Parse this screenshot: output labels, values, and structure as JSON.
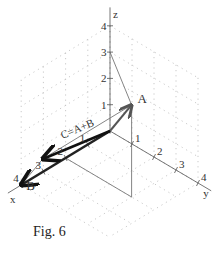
{
  "figure": {
    "caption": "Fig. 6",
    "axes": {
      "x": {
        "name": "x",
        "ticks": [
          "1",
          "2",
          "3",
          "4"
        ]
      },
      "y": {
        "name": "y",
        "ticks": [
          "1",
          "2",
          "3",
          "4"
        ]
      },
      "z": {
        "name": "z",
        "ticks": [
          "1",
          "2",
          "3",
          "4"
        ]
      }
    },
    "vectors": [
      {
        "id": "A",
        "label": "A",
        "components": [
          2,
          3,
          3.5
        ],
        "color": "#555555",
        "style": "medium"
      },
      {
        "id": "B",
        "label": "B",
        "components": [
          4,
          0,
          0
        ],
        "color": "#222222",
        "style": "bold"
      },
      {
        "id": "C",
        "label": "C=A+B",
        "components": [
          6,
          3,
          3.5
        ],
        "color": "#111111",
        "style": "bold"
      }
    ],
    "colors": {
      "grid": "#bbbbbb",
      "axis": "#666666",
      "construction": "#777777"
    }
  }
}
